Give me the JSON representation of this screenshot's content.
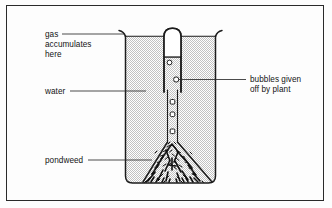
{
  "labels": {
    "gas": {
      "name": "gas-accumulates-here",
      "lines": [
        "gas",
        "accumulates",
        "here"
      ],
      "line1": "gas",
      "line2": "accumulates",
      "line3": "here"
    },
    "water": {
      "name": "water",
      "text": "water"
    },
    "pondweed": {
      "name": "pondweed",
      "text": "pondweed"
    },
    "bubbles": {
      "name": "bubbles-given-off-by-plant",
      "lines": [
        "bubbles given",
        "off by plant"
      ],
      "line1": "bubbles given",
      "line2": "off by plant"
    }
  },
  "apparatus": {
    "beaker": "beaker",
    "test_tube": "inverted-test-tube",
    "funnel": "funnel",
    "plant": "pondweed-mass",
    "gas_pocket": "collected-gas",
    "water_body": "water"
  },
  "colors": {
    "ink": "#1c1c1c",
    "line": "#2b2b2b",
    "water_fill": "#c9c9c9",
    "page": "#fdfdfd",
    "gas_fill": "#ffffff"
  }
}
